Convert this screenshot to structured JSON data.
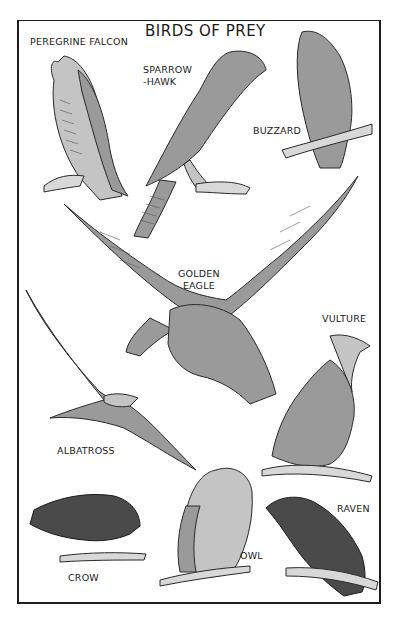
{
  "page": {
    "title": "BIRDS OF PREY"
  },
  "birds": [
    {
      "id": "peregrine-falcon",
      "label": "PEREGRINE FALCON"
    },
    {
      "id": "sparrowhawk",
      "label": "SPARROW\n-HAWK"
    },
    {
      "id": "buzzard",
      "label": "BUZZARD"
    },
    {
      "id": "golden-eagle",
      "label": "GOLDEN\nEAGLE"
    },
    {
      "id": "vulture",
      "label": "VULTURE"
    },
    {
      "id": "albatross",
      "label": "ALBATROSS"
    },
    {
      "id": "crow",
      "label": "CROW"
    },
    {
      "id": "owl",
      "label": "OWL"
    },
    {
      "id": "raven",
      "label": "RAVEN"
    }
  ]
}
